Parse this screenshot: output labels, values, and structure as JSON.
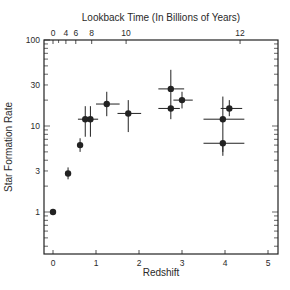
{
  "chart_data": {
    "type": "scatter",
    "title": "",
    "xlabel": "Redshift",
    "ylabel": "Star Formation Rate",
    "x2label": "Lookback Time (In Billions of Years)",
    "xlim": [
      -0.2,
      5.2
    ],
    "ylim": [
      0.32,
      100
    ],
    "yscale": "log",
    "grid": false,
    "legend": null,
    "x_ticks": [
      0,
      1,
      2,
      3,
      4,
      5
    ],
    "y_ticks": [
      1,
      3,
      10,
      30,
      100
    ],
    "x2_ticks": [
      {
        "label": "0",
        "redshift": 0.0
      },
      {
        "label": "4",
        "redshift": 0.3
      },
      {
        "label": "6",
        "redshift": 0.53
      },
      {
        "label": "8",
        "redshift": 0.9
      },
      {
        "label": "10",
        "redshift": 1.7
      },
      {
        "label": "12",
        "redshift": 4.35
      }
    ],
    "points": [
      {
        "x": 0.0,
        "y": 1.0,
        "xerr": [
          0,
          0
        ],
        "yerr": [
          1.0,
          1.0
        ]
      },
      {
        "x": 0.35,
        "y": 2.8,
        "xerr": [
          0.35,
          0.35
        ],
        "yerr": [
          2.4,
          3.3
        ]
      },
      {
        "x": 0.63,
        "y": 6.0,
        "xerr": [
          0.63,
          0.63
        ],
        "yerr": [
          5.0,
          7.2
        ]
      },
      {
        "x": 0.75,
        "y": 12.0,
        "xerr": [
          0.58,
          0.75
        ],
        "yerr": [
          7.5,
          17.0
        ]
      },
      {
        "x": 0.87,
        "y": 12.0,
        "xerr": [
          0.87,
          1.05
        ],
        "yerr": [
          7.5,
          17.0
        ]
      },
      {
        "x": 1.25,
        "y": 18.0,
        "xerr": [
          1.0,
          1.55
        ],
        "yerr": [
          13.0,
          25.0
        ]
      },
      {
        "x": 1.75,
        "y": 14.0,
        "xerr": [
          1.5,
          2.05
        ],
        "yerr": [
          8.5,
          20.0
        ]
      },
      {
        "x": 2.74,
        "y": 27.0,
        "xerr": [
          2.45,
          3.05
        ],
        "yerr": [
          15.0,
          45.0
        ]
      },
      {
        "x": 2.74,
        "y": 16.0,
        "xerr": [
          2.45,
          2.95
        ],
        "yerr": [
          12.0,
          16.0
        ]
      },
      {
        "x": 3.0,
        "y": 20.0,
        "xerr": [
          2.8,
          3.25
        ],
        "yerr": [
          16.0,
          25.0
        ]
      },
      {
        "x": 3.95,
        "y": 12.0,
        "xerr": [
          3.5,
          4.45
        ],
        "yerr": [
          5.0,
          22.0
        ]
      },
      {
        "x": 3.95,
        "y": 6.3,
        "xerr": [
          3.5,
          4.45
        ],
        "yerr": [
          4.5,
          6.3
        ]
      },
      {
        "x": 4.1,
        "y": 16.0,
        "xerr": [
          3.9,
          4.4
        ],
        "yerr": [
          13.0,
          20.0
        ]
      }
    ]
  },
  "labels": {
    "xlabel": "Redshift",
    "ylabel": "Star Formation Rate",
    "x2label": "Lookback Time (In Billions of Years)"
  },
  "colors": {
    "ink": "#222222",
    "background": "#ffffff"
  }
}
